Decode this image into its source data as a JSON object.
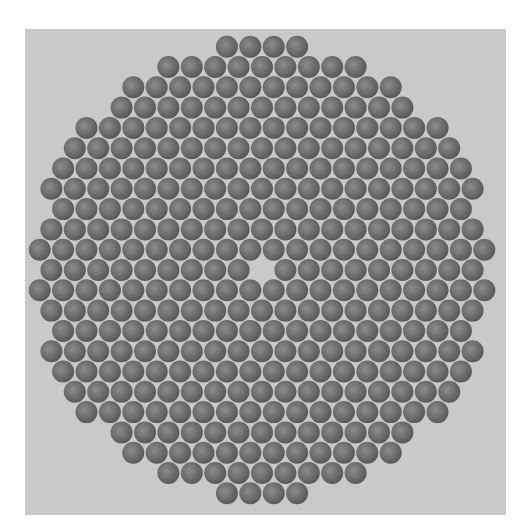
{
  "image": {
    "description": "Microscope cross-section of a hexagonally packed optical fiber bundle with a missing central fiber",
    "background_color": "#ffffff",
    "panel_color": "#c9c9c9",
    "fiber_color_dark": "#5a5a5a",
    "fiber_color_light": "#8a8a8a",
    "gap_color": "#d6d6d6"
  },
  "bundle": {
    "center_x": 262,
    "center_y": 270,
    "pitch_x": 23.4,
    "pitch_y": 20.3,
    "fiber_radius": 11,
    "bundle_radius": 228,
    "missing_center": true
  }
}
